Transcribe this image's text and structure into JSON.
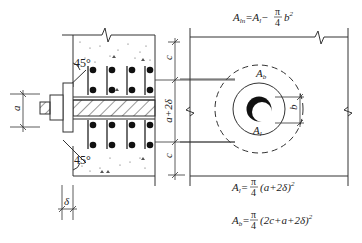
{
  "diagram": {
    "type": "anchor-bolt-cone-failure-area",
    "left_view": {
      "angle_top": "45°",
      "angle_bottom": "45°",
      "dim_a": "a",
      "dim_delta": "δ",
      "dim_c_top": "c",
      "dim_middle": "a+2δ",
      "dim_c_bottom": "c"
    },
    "right_view": {
      "label_Ab": "A",
      "label_Ab_sub": "b",
      "label_Al": "A",
      "label_Al_sub": "l",
      "dim_b": "b"
    },
    "formulas": {
      "f1": {
        "lhs": "A",
        "lhs_sub": "ln",
        "eq": "=A",
        "eq_sub": "l",
        "minus": "−",
        "frac_num": "π",
        "frac_den": "4",
        "rest": "b",
        "rest_sup": "2"
      },
      "f2": {
        "lhs": "A",
        "lhs_sub": "l",
        "eq": "=",
        "frac_num": "π",
        "frac_den": "4",
        "rest": "(a+2δ)",
        "rest_sup": "2"
      },
      "f3": {
        "lhs": "A",
        "lhs_sub": "b",
        "eq": "=",
        "frac_num": "π",
        "frac_den": "4",
        "rest": "(2c+a+2δ)",
        "rest_sup": "2"
      }
    }
  }
}
